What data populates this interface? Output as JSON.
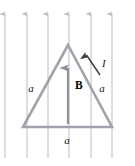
{
  "figure": {
    "background_color": "#ffffff",
    "width": 135,
    "height": 166
  },
  "colors": {
    "field_line": "#b9bcc4",
    "field_line_arrow": "#b9bcc4",
    "loop_stroke": "#a0a3ab",
    "b_arrow": "#8e9199",
    "current_arrow": "#3a3a3a",
    "label": "#1a1a1a"
  },
  "field": {
    "name": "uniform-magnetic-field",
    "direction": "up",
    "line_count": 6,
    "line_x_positions": [
      5,
      27,
      48,
      69,
      91,
      112
    ],
    "line_top_y": 12,
    "line_bottom_y": 158,
    "arrow_head_y": 14
  },
  "loop": {
    "name": "equilateral-triangle-loop",
    "shape": "equilateral-triangle",
    "apex": {
      "x": 68,
      "y": 45
    },
    "bottom_left": {
      "x": 23,
      "y": 127
    },
    "bottom_right": {
      "x": 112,
      "y": 127
    },
    "stroke_width": 2.6
  },
  "labels": {
    "side_left": {
      "text": "a",
      "x": 31,
      "y": 91,
      "style": "italic"
    },
    "side_right": {
      "text": "a",
      "x": 101,
      "y": 91,
      "style": "italic"
    },
    "side_bottom": {
      "text": "a",
      "x": 67,
      "y": 142,
      "style": "italic"
    },
    "field_symbol": {
      "text": "B",
      "x": 74,
      "y": 87,
      "style": "bold"
    },
    "current_symbol": {
      "text": "I",
      "x": 102,
      "y": 65,
      "style": "italic"
    }
  },
  "b_vector": {
    "name": "b-field-vector",
    "x": 68,
    "tail_y": 124,
    "head_y": 66,
    "direction": "up",
    "stroke_width": 2.2
  },
  "current_vector": {
    "name": "current-direction-arrow",
    "tail_x": 100,
    "tail_y": 75,
    "head_x": 85,
    "head_y": 53,
    "direction": "up-left-along-right-side",
    "stroke_width": 1.4
  }
}
